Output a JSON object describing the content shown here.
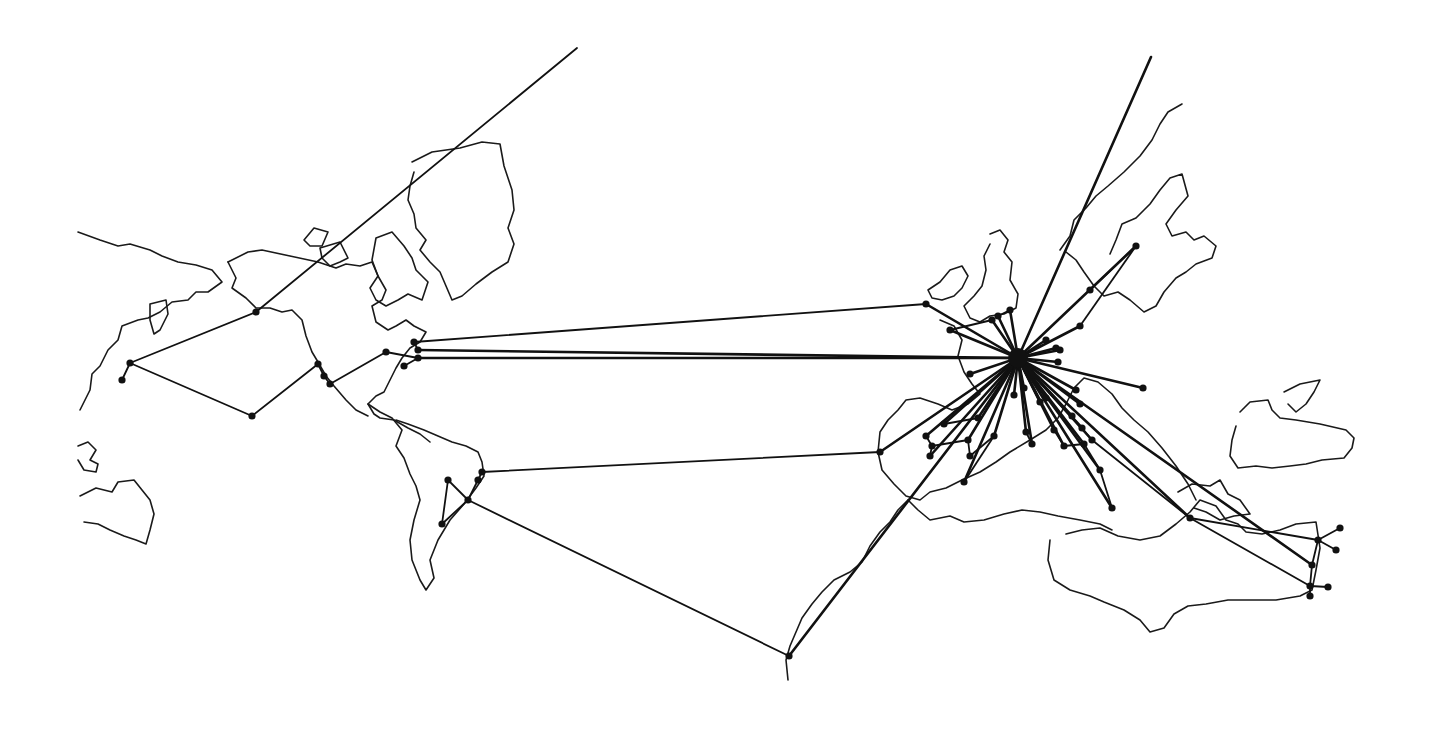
{
  "map": {
    "style": "hand-drawn network map",
    "colors": {
      "background": "#ffffff",
      "ink": "#111111"
    },
    "hub": {
      "id": "hub",
      "x": 1018,
      "y": 358
    },
    "coastlines": [
      {
        "name": "north-america-west",
        "points": "78,232 100,240 118,246 130,244 150,250 162,256 178,262 196,265 212,270 222,282 208,292 196,292 188,300 172,302 160,312 148,318 138,320 122,326 118,340 108,350 100,366 92,374 90,390 80,410"
      },
      {
        "name": "alaska-island",
        "points": "150,304 166,300 168,314 160,330 154,334 150,320 150,304"
      },
      {
        "name": "north-america-main",
        "points": "228,262 248,252 262,250 290,256 318,262 336,268 346,264 360,266 372,262 378,276 386,290 382,300 372,306 376,322 388,330 396,326 406,320 414,326 426,332 420,342 410,348 402,358 396,368 390,380 384,392 376,396 368,404 374,414 380,418 394,420 408,428 420,434 430,442"
      },
      {
        "name": "north-america-coast-west",
        "points": "228,262 236,278 232,288 246,298 256,308 270,308 282,312 292,310 302,320 306,336 312,352 318,362 326,376 334,386 346,400 356,410 368,416"
      },
      {
        "name": "greenland",
        "points": "412,162 432,152 460,148 482,142 500,144 504,166 512,190 514,210 508,228 514,244 508,262 492,272 476,284 462,296 452,300 446,286 440,272 430,262 420,250 426,240 416,228 414,214 408,200 410,186 414,172"
      },
      {
        "name": "arctic-island-1",
        "points": "304,240 314,228 328,232 322,246 310,246 304,240"
      },
      {
        "name": "arctic-island-2",
        "points": "320,248 340,242 348,258 340,262 330,266 322,258 320,248"
      },
      {
        "name": "baffin",
        "points": "376,238 392,232 404,246 412,258 416,270 428,282 422,300 408,294 398,300 386,306 376,300 370,288 378,276 372,260 376,238"
      },
      {
        "name": "central-america",
        "points": "368,404 380,412 392,418 402,430 396,446 404,458 410,474 416,486 420,500 414,520 410,540 412,560 420,580 426,590 434,578 430,560 438,540 450,520 464,504 476,488 484,476 482,462 478,452 466,446 452,442 438,436 424,430 408,424 396,420"
      },
      {
        "name": "pacific-island-1",
        "points": "78,446 88,442 96,450 90,460 98,464 96,472 84,470 78,460"
      },
      {
        "name": "pacific-island-2",
        "points": "80,496 96,488 112,492 118,482 134,480 142,490 150,500 154,514 150,530 146,544 136,540 124,536 110,530 98,524 84,522"
      },
      {
        "name": "british-isles-ireland",
        "points": "928,290 940,282 950,270 962,266 968,276 962,288 954,296 942,300 932,298 928,290"
      },
      {
        "name": "british-isles-gb",
        "points": "990,234 1000,230 1008,240 1004,252 1012,262 1010,280 1018,294 1016,308 1004,314 990,316 980,322 970,318 964,306 974,296 982,286 986,270 984,256 990,244"
      },
      {
        "name": "scandinavia",
        "points": "1060,250 1070,236 1074,220 1086,208 1096,196 1108,186 1124,172 1140,156 1152,140 1160,124 1168,112 1182,104"
      },
      {
        "name": "scandinavia-2",
        "points": "1066,252 1076,260 1084,272 1094,286 1104,296 1118,292 1130,300 1144,312 1156,306 1164,292 1176,278 1186,272 1196,264 1212,258 1216,246 1204,236 1194,240 1186,232 1172,236 1166,224 1176,210 1188,196 1182,174 1170,178 1160,190 1150,204 1136,218 1122,224 1116,240 1110,254"
      },
      {
        "name": "europe-mainland",
        "points": "940,320 954,326 962,340 958,356 964,372 972,384 980,394 968,404 952,410 938,404 920,398 906,400 898,410 888,420 880,432 878,452 882,470 894,484 906,496 920,500 930,492 946,488 962,480 980,472 996,462 1010,452 1030,440 1046,430 1058,418 1066,404 1074,388 1084,378 1098,382 1112,394 1122,408 1134,420 1148,432 1162,448 1176,466 1188,484 1196,500"
      },
      {
        "name": "africa-north",
        "points": "908,500 918,510 930,520 950,516 964,522 984,520 1004,514 1022,510 1040,512 1058,516 1080,520 1100,524 1112,530"
      },
      {
        "name": "africa-west",
        "points": "908,500 898,510 890,522 880,532 870,546 862,562 850,572 834,580 822,592 812,604 802,618 796,632 790,646 786,660 788,680"
      },
      {
        "name": "middle-east",
        "points": "1050,540 1048,560 1054,580 1070,590 1090,596 1104,602 1124,610 1140,620 1150,632 1164,628 1174,614 1188,606 1206,604 1228,600 1252,600 1276,600 1300,596 1312,590 1316,570 1320,548 1316,522 1296,524 1280,530 1262,534 1246,532 1238,524 1226,520 1216,506 1200,500 1190,512 1176,524 1160,536 1140,540 1118,536 1100,528 1082,530 1066,534"
      },
      {
        "name": "black-sea-area",
        "points": "1178,492 1192,484 1210,486 1220,480 1228,494 1240,500 1250,514 1234,516 1220,520 1206,512 1194,508"
      },
      {
        "name": "caspian-region",
        "points": "1240,412 1250,402 1268,400 1272,410 1280,418 1296,420 1320,424 1346,430 1354,438 1352,448 1344,458 1322,460 1306,464 1290,466 1272,468 1256,466 1238,468 1230,456 1232,440 1236,426"
      },
      {
        "name": "caspian-inner",
        "points": "1284,392 1300,384 1320,380 1314,392 1306,404 1296,412 1288,404"
      }
    ],
    "nodes": [
      {
        "id": "alaska-1",
        "x": 130,
        "y": 363
      },
      {
        "id": "alaska-2",
        "x": 122,
        "y": 380
      },
      {
        "id": "north-pacific",
        "x": 256,
        "y": 312
      },
      {
        "id": "mid-pacific",
        "x": 252,
        "y": 416
      },
      {
        "id": "west-coast-1",
        "x": 318,
        "y": 364
      },
      {
        "id": "west-coast-2",
        "x": 324,
        "y": 376
      },
      {
        "id": "west-coast-3",
        "x": 330,
        "y": 384
      },
      {
        "id": "mid-us",
        "x": 386,
        "y": 352
      },
      {
        "id": "east-us-1",
        "x": 414,
        "y": 342
      },
      {
        "id": "east-us-2",
        "x": 418,
        "y": 350
      },
      {
        "id": "east-us-3",
        "x": 418,
        "y": 358
      },
      {
        "id": "east-us-4",
        "x": 404,
        "y": 366
      },
      {
        "id": "brazil-1",
        "x": 482,
        "y": 472
      },
      {
        "id": "brazil-2",
        "x": 478,
        "y": 480
      },
      {
        "id": "brazil-hub",
        "x": 468,
        "y": 500
      },
      {
        "id": "brazil-3",
        "x": 448,
        "y": 480
      },
      {
        "id": "brazil-4",
        "x": 442,
        "y": 524
      },
      {
        "id": "africa-south",
        "x": 789,
        "y": 656
      },
      {
        "id": "iberia-west",
        "x": 880,
        "y": 452
      },
      {
        "id": "ireland",
        "x": 926,
        "y": 304
      },
      {
        "id": "scand-1",
        "x": 1136,
        "y": 246
      },
      {
        "id": "scand-2",
        "x": 1090,
        "y": 290
      },
      {
        "id": "scand-3",
        "x": 1080,
        "y": 326
      },
      {
        "id": "east-1",
        "x": 1143,
        "y": 388
      },
      {
        "id": "greece",
        "x": 1190,
        "y": 518
      },
      {
        "id": "me-1",
        "x": 1340,
        "y": 528
      },
      {
        "id": "me-2",
        "x": 1336,
        "y": 550
      },
      {
        "id": "me-3",
        "x": 1318,
        "y": 540
      },
      {
        "id": "me-4",
        "x": 1312,
        "y": 565
      },
      {
        "id": "me-5",
        "x": 1328,
        "y": 587
      },
      {
        "id": "me-6",
        "x": 1310,
        "y": 596
      },
      {
        "id": "me-7",
        "x": 1310,
        "y": 586
      },
      {
        "id": "eu-a",
        "x": 992,
        "y": 320
      },
      {
        "id": "eu-b",
        "x": 998,
        "y": 316
      },
      {
        "id": "eu-c",
        "x": 950,
        "y": 330
      },
      {
        "id": "eu-d",
        "x": 1010,
        "y": 310
      },
      {
        "id": "eu-e",
        "x": 1060,
        "y": 350
      },
      {
        "id": "eu-f",
        "x": 1058,
        "y": 362
      },
      {
        "id": "eu-g",
        "x": 1056,
        "y": 348
      },
      {
        "id": "eu-h",
        "x": 1046,
        "y": 340
      },
      {
        "id": "eu-i",
        "x": 970,
        "y": 374
      },
      {
        "id": "eu-j",
        "x": 1014,
        "y": 395
      },
      {
        "id": "eu-k",
        "x": 1024,
        "y": 388
      },
      {
        "id": "eu-l",
        "x": 1040,
        "y": 402
      },
      {
        "id": "eu-m",
        "x": 1046,
        "y": 398
      },
      {
        "id": "eu-n",
        "x": 1076,
        "y": 390
      },
      {
        "id": "eu-o",
        "x": 1080,
        "y": 404
      },
      {
        "id": "eu-p",
        "x": 1072,
        "y": 416
      },
      {
        "id": "iberia-1",
        "x": 926,
        "y": 436
      },
      {
        "id": "iberia-2",
        "x": 930,
        "y": 456
      },
      {
        "id": "iberia-3",
        "x": 932,
        "y": 446
      },
      {
        "id": "iberia-4",
        "x": 944,
        "y": 424
      },
      {
        "id": "iberia-5",
        "x": 964,
        "y": 482
      },
      {
        "id": "iberia-6",
        "x": 968,
        "y": 440
      },
      {
        "id": "iberia-7",
        "x": 970,
        "y": 456
      },
      {
        "id": "iberia-8",
        "x": 978,
        "y": 418
      },
      {
        "id": "iberia-9",
        "x": 994,
        "y": 436
      },
      {
        "id": "italy-1",
        "x": 1026,
        "y": 432
      },
      {
        "id": "italy-2",
        "x": 1032,
        "y": 444
      },
      {
        "id": "italy-3",
        "x": 1054,
        "y": 430
      },
      {
        "id": "italy-4",
        "x": 1064,
        "y": 446
      },
      {
        "id": "italy-5",
        "x": 1084,
        "y": 444
      },
      {
        "id": "italy-6",
        "x": 1100,
        "y": 470
      },
      {
        "id": "italy-7",
        "x": 1112,
        "y": 508
      },
      {
        "id": "balkan-1",
        "x": 1082,
        "y": 428
      },
      {
        "id": "balkan-2",
        "x": 1092,
        "y": 440
      }
    ],
    "edges": [
      [
        "hub",
        "ireland"
      ],
      [
        "ireland",
        "east-us-1"
      ],
      [
        "hub",
        "east-us-2"
      ],
      [
        "hub",
        "east-us-3"
      ],
      [
        "east-us-1",
        "east-us-2"
      ],
      [
        "east-us-3",
        "mid-us"
      ],
      [
        "east-us-3",
        "east-us-4"
      ],
      [
        "mid-us",
        "west-coast-3"
      ],
      [
        "west-coast-3",
        "west-coast-2"
      ],
      [
        "west-coast-2",
        "west-coast-1"
      ],
      [
        "west-coast-1",
        "mid-pacific"
      ],
      [
        "mid-pacific",
        "alaska-1"
      ],
      [
        "alaska-1",
        "north-pacific"
      ],
      [
        "alaska-1",
        "alaska-2"
      ],
      [
        "north-pacific",
        "far-north-pacific"
      ],
      [
        "hub",
        "iberia-west"
      ],
      [
        "iberia-west",
        "brazil-1"
      ],
      [
        "brazil-1",
        "brazil-2"
      ],
      [
        "brazil-2",
        "brazil-hub"
      ],
      [
        "brazil-hub",
        "brazil-3"
      ],
      [
        "brazil-hub",
        "brazil-4"
      ],
      [
        "brazil-3",
        "brazil-4"
      ],
      [
        "brazil-hub",
        "africa-south"
      ],
      [
        "africa-south",
        "hub"
      ],
      [
        "hub",
        "far-north"
      ],
      [
        "hub",
        "scand-1"
      ],
      [
        "scand-1",
        "scand-2"
      ],
      [
        "scand-1",
        "scand-3"
      ],
      [
        "hub",
        "scand-3"
      ],
      [
        "hub",
        "east-1"
      ],
      [
        "hub",
        "greece"
      ],
      [
        "greece",
        "me-3"
      ],
      [
        "greece",
        "me-7"
      ],
      [
        "hub",
        "me-4"
      ],
      [
        "me-3",
        "me-1"
      ],
      [
        "me-3",
        "me-2"
      ],
      [
        "me-3",
        "me-4"
      ],
      [
        "me-4",
        "me-7"
      ],
      [
        "me-7",
        "me-5"
      ],
      [
        "me-7",
        "me-6"
      ],
      [
        "hub",
        "eu-a"
      ],
      [
        "hub",
        "eu-b"
      ],
      [
        "hub",
        "eu-c"
      ],
      [
        "hub",
        "eu-d"
      ],
      [
        "eu-a",
        "eu-c"
      ],
      [
        "eu-b",
        "eu-d"
      ],
      [
        "hub",
        "eu-e"
      ],
      [
        "hub",
        "eu-f"
      ],
      [
        "hub",
        "eu-g"
      ],
      [
        "hub",
        "eu-h"
      ],
      [
        "hub",
        "eu-i"
      ],
      [
        "hub",
        "eu-j"
      ],
      [
        "hub",
        "eu-k"
      ],
      [
        "hub",
        "eu-l"
      ],
      [
        "hub",
        "eu-m"
      ],
      [
        "hub",
        "eu-n"
      ],
      [
        "hub",
        "eu-o"
      ],
      [
        "hub",
        "eu-p"
      ],
      [
        "hub",
        "iberia-1"
      ],
      [
        "hub",
        "iberia-2"
      ],
      [
        "hub",
        "iberia-4"
      ],
      [
        "hub",
        "iberia-5"
      ],
      [
        "hub",
        "iberia-6"
      ],
      [
        "hub",
        "iberia-8"
      ],
      [
        "hub",
        "iberia-9"
      ],
      [
        "iberia-1",
        "iberia-3"
      ],
      [
        "iberia-3",
        "iberia-2"
      ],
      [
        "iberia-3",
        "iberia-6"
      ],
      [
        "iberia-6",
        "iberia-7"
      ],
      [
        "iberia-7",
        "iberia-9"
      ],
      [
        "iberia-8",
        "iberia-4"
      ],
      [
        "iberia-9",
        "iberia-5"
      ],
      [
        "hub",
        "italy-1"
      ],
      [
        "hub",
        "italy-2"
      ],
      [
        "hub",
        "italy-3"
      ],
      [
        "hub",
        "italy-4"
      ],
      [
        "hub",
        "italy-5"
      ],
      [
        "hub",
        "italy-6"
      ],
      [
        "hub",
        "italy-7"
      ],
      [
        "italy-1",
        "italy-2"
      ],
      [
        "italy-3",
        "italy-4"
      ],
      [
        "italy-4",
        "italy-5"
      ],
      [
        "italy-5",
        "italy-6"
      ],
      [
        "italy-6",
        "italy-7"
      ],
      [
        "hub",
        "balkan-1"
      ],
      [
        "hub",
        "balkan-2"
      ],
      [
        "balkan-1",
        "balkan-2"
      ],
      [
        "balkan-2",
        "greece"
      ]
    ],
    "extra_points": [
      {
        "id": "far-north-pacific",
        "x": 577,
        "y": 48
      },
      {
        "id": "far-north",
        "x": 1151,
        "y": 57
      }
    ]
  }
}
